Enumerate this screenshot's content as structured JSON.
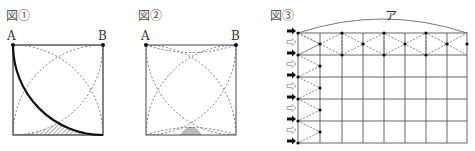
{
  "figures": [
    {
      "id": "fig1",
      "label": "図①",
      "points": {
        "A": "A",
        "B": "B"
      },
      "description": "Square with quarter-circle arcs (dashed) from each corner; bold quarter arc centered at bottom-left; hatched region at bottom-right"
    },
    {
      "id": "fig2",
      "label": "図②",
      "points": {
        "A": "A",
        "B": "B"
      },
      "description": "Square with dashed quarter-circle arcs; shaded small region at bottom center"
    },
    {
      "id": "fig3",
      "label": "図③",
      "dimension_label": "ア",
      "grid": {
        "columns": 8,
        "rows": 5
      },
      "arrows": [
        "filled",
        "outline",
        "filled",
        "outline",
        "filled",
        "outline",
        "filled",
        "outline",
        "filled",
        "outline",
        "filled"
      ]
    }
  ],
  "colors": {
    "line": "#333333",
    "dashed": "#555555",
    "shade": "#bbbbbb",
    "hatch": "#444444"
  }
}
